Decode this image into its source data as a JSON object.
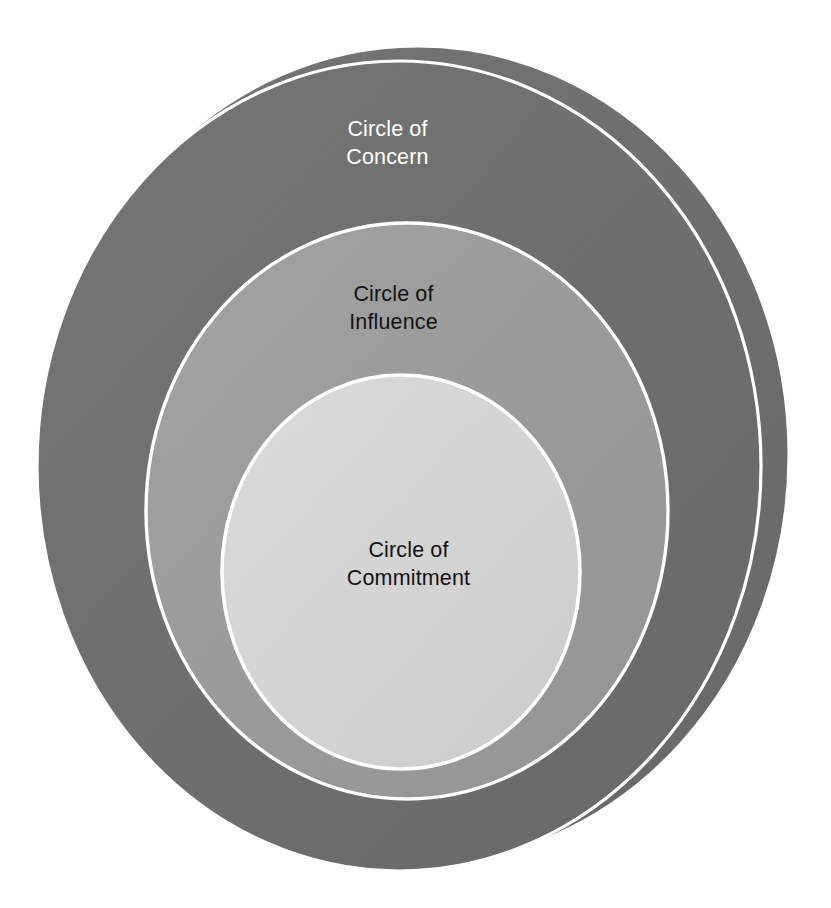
{
  "diagram": {
    "type": "concentric-circles",
    "background_color": "#FFFFFF",
    "stroke_color": "#FFFFFF",
    "rings": [
      {
        "id": "concern",
        "label": "Circle of\nConcern",
        "label_line_1": "Circle of",
        "label_line_2": "Concern",
        "fill_color": "#6E6E6E",
        "text_color": "#FFFFFF",
        "level": 1,
        "geometry": {
          "cx": 418,
          "cy": 455,
          "rx": 372,
          "ry": 410
        }
      },
      {
        "id": "concern-shadow",
        "label": "",
        "fill_color": "#6E6E6E",
        "text_color": "#FFFFFF",
        "level": 2,
        "geometry": {
          "cx": 399,
          "cy": 466,
          "rx": 363,
          "ry": 406
        }
      },
      {
        "id": "influence",
        "label": "Circle of\nInfluence",
        "label_line_1": "Circle of",
        "label_line_2": "Influence",
        "fill_color": "#9A9A9A",
        "text_color": "#121212",
        "level": 3,
        "geometry": {
          "cx": 407,
          "cy": 511,
          "rx": 262,
          "ry": 289
        }
      },
      {
        "id": "commitment",
        "label": "Circle of\nCommitment",
        "label_line_1": "Circle of",
        "label_line_2": "Commitment",
        "fill_color": "#D3D3D3",
        "text_color": "#121212",
        "level": 4,
        "geometry": {
          "cx": 401,
          "cy": 572,
          "rx": 180,
          "ry": 198
        }
      }
    ]
  },
  "chart_data": {
    "type": "pie",
    "title": "Circle of Concern",
    "subtitle": "",
    "xlabel": "",
    "ylabel": "",
    "legend_position": "none",
    "grid": false,
    "categories": [
      "Circle of Concern",
      "Circle of Influence",
      "Circle of Commitment"
    ],
    "values": [
      3,
      2,
      1
    ],
    "annotations": [
      "Circle of Concern",
      "Circle of Influence",
      "Circle of Commitment"
    ],
    "series": [
      {
        "name": "nesting level",
        "values": [
          3,
          2,
          1
        ]
      }
    ],
    "colors": [
      "#6E6E6E",
      "#9A9A9A",
      "#D3D3D3"
    ]
  }
}
